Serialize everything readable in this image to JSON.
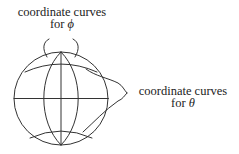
{
  "diagram": {
    "type": "sphere-coordinate-curves",
    "labels": {
      "phi": {
        "line1": "coordinate curves",
        "line2_prefix": "for ",
        "symbol": "ϕ"
      },
      "theta": {
        "line1": "coordinate curves",
        "line2_prefix": "for ",
        "symbol": "θ"
      }
    },
    "colors": {
      "stroke": "#333333",
      "text": "#222222",
      "background": "#ffffff"
    }
  }
}
